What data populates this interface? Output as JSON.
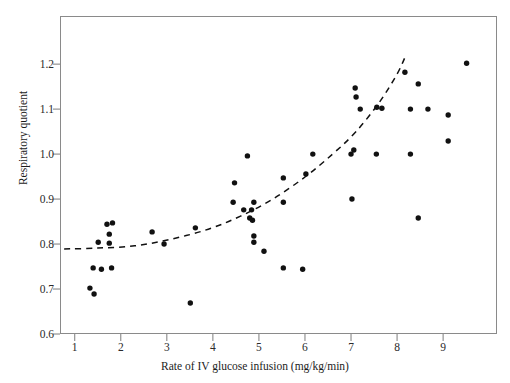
{
  "chart_data": {
    "type": "scatter",
    "title": "",
    "xlabel": "Rate of IV glucose infusion (mg/kg/min)",
    "ylabel": "Respiratory quotient",
    "xlim": [
      0.68,
      10.17
    ],
    "ylim": [
      0.6,
      1.307
    ],
    "xticks": [
      1,
      2,
      3,
      4,
      5,
      6,
      7,
      8,
      9
    ],
    "xtick_labels": [
      "1",
      "2",
      "3",
      "4",
      "5",
      "6",
      "7",
      "8",
      "9"
    ],
    "yticks": [
      0.6,
      0.7,
      0.8,
      0.9,
      1.0,
      1.1,
      1.2
    ],
    "ytick_labels": [
      "0.6",
      "0.7",
      "0.8",
      "0.9",
      "1.0",
      "1.1",
      "1.2"
    ],
    "grid": false,
    "legend": null,
    "marker": {
      "shape": "circle",
      "color": "#111111",
      "size": 5.4
    },
    "points": [
      {
        "x": 1.33,
        "y": 0.702
      },
      {
        "x": 1.42,
        "y": 0.689
      },
      {
        "x": 1.4,
        "y": 0.747
      },
      {
        "x": 1.58,
        "y": 0.744
      },
      {
        "x": 1.8,
        "y": 0.747
      },
      {
        "x": 1.7,
        "y": 0.844
      },
      {
        "x": 1.82,
        "y": 0.847
      },
      {
        "x": 1.51,
        "y": 0.804
      },
      {
        "x": 1.75,
        "y": 0.822
      },
      {
        "x": 1.75,
        "y": 0.802
      },
      {
        "x": 2.68,
        "y": 0.827
      },
      {
        "x": 2.94,
        "y": 0.8
      },
      {
        "x": 3.51,
        "y": 0.669
      },
      {
        "x": 3.62,
        "y": 0.836
      },
      {
        "x": 4.47,
        "y": 0.936
      },
      {
        "x": 4.44,
        "y": 0.893
      },
      {
        "x": 4.67,
        "y": 0.876
      },
      {
        "x": 4.75,
        "y": 0.996
      },
      {
        "x": 4.84,
        "y": 0.876
      },
      {
        "x": 4.89,
        "y": 0.893
      },
      {
        "x": 4.8,
        "y": 0.858
      },
      {
        "x": 4.86,
        "y": 0.853
      },
      {
        "x": 4.89,
        "y": 0.818
      },
      {
        "x": 4.89,
        "y": 0.804
      },
      {
        "x": 5.11,
        "y": 0.784
      },
      {
        "x": 5.53,
        "y": 0.947
      },
      {
        "x": 5.53,
        "y": 0.893
      },
      {
        "x": 5.53,
        "y": 0.747
      },
      {
        "x": 5.95,
        "y": 0.744
      },
      {
        "x": 6.02,
        "y": 0.956
      },
      {
        "x": 6.17,
        "y": 1.0
      },
      {
        "x": 7.0,
        "y": 1.0
      },
      {
        "x": 7.06,
        "y": 1.009
      },
      {
        "x": 7.09,
        "y": 1.147
      },
      {
        "x": 7.11,
        "y": 1.127
      },
      {
        "x": 7.2,
        "y": 1.1
      },
      {
        "x": 7.02,
        "y": 0.9
      },
      {
        "x": 7.56,
        "y": 1.104
      },
      {
        "x": 7.67,
        "y": 1.102
      },
      {
        "x": 7.55,
        "y": 1.0
      },
      {
        "x": 8.17,
        "y": 1.182
      },
      {
        "x": 8.46,
        "y": 1.156
      },
      {
        "x": 8.29,
        "y": 1.1
      },
      {
        "x": 8.67,
        "y": 1.1
      },
      {
        "x": 8.29,
        "y": 1.0
      },
      {
        "x": 8.46,
        "y": 0.858
      },
      {
        "x": 9.11,
        "y": 1.087
      },
      {
        "x": 9.11,
        "y": 1.029
      },
      {
        "x": 9.51,
        "y": 1.202
      }
    ],
    "trend": {
      "style": "dashed",
      "color": "#111111",
      "description": "Exponentially rising dashed fit curve",
      "points": [
        {
          "x": 0.77,
          "y": 0.789
        },
        {
          "x": 1.5,
          "y": 0.791
        },
        {
          "x": 2.3,
          "y": 0.796
        },
        {
          "x": 3.1,
          "y": 0.811
        },
        {
          "x": 3.9,
          "y": 0.833
        },
        {
          "x": 4.6,
          "y": 0.862
        },
        {
          "x": 5.3,
          "y": 0.9
        },
        {
          "x": 6.0,
          "y": 0.949
        },
        {
          "x": 6.6,
          "y": 1.0
        },
        {
          "x": 7.1,
          "y": 1.049
        },
        {
          "x": 7.6,
          "y": 1.113
        },
        {
          "x": 8.0,
          "y": 1.178
        },
        {
          "x": 8.2,
          "y": 1.222
        }
      ]
    }
  },
  "axes": {
    "y_title": "Respiratory quotient",
    "x_title": "Rate of IV glucose infusion (mg/kg/min)"
  }
}
